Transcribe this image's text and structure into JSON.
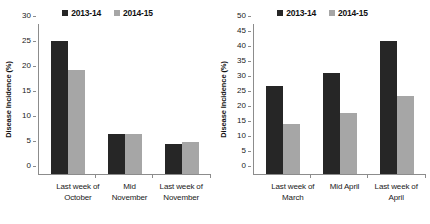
{
  "chart_data": [
    {
      "id": "autumn-chart",
      "type": "bar",
      "title": "",
      "xlabel": "",
      "ylabel": "Disease Incidence (%)",
      "ylim": [
        0,
        30
      ],
      "yticks": [
        0,
        5,
        10,
        15,
        20,
        25,
        30
      ],
      "ytick_labels": [
        "0",
        "5",
        "10",
        "15",
        "20",
        "25",
        "30"
      ],
      "grid": false,
      "legend_position": "top-center",
      "categories": [
        "Last week of October",
        "Mid November",
        "Last week of November"
      ],
      "category_lines": [
        [
          "Last week of",
          "October"
        ],
        [
          "Mid",
          "November"
        ],
        [
          "Last week of",
          "November"
        ]
      ],
      "series": [
        {
          "name": "2013-14",
          "color": "#262626",
          "values": [
            26.7,
            8.0,
            6.1
          ]
        },
        {
          "name": "2014-15",
          "color": "#a6a6a6",
          "values": [
            20.9,
            8.0,
            6.4
          ]
        }
      ]
    },
    {
      "id": "spring-chart",
      "type": "bar",
      "title": "",
      "xlabel": "",
      "ylabel": "Disease Incidence (%)",
      "ylim": [
        0,
        50
      ],
      "yticks": [
        0,
        5,
        10,
        15,
        20,
        25,
        30,
        35,
        40,
        45,
        50
      ],
      "ytick_labels": [
        "0",
        "5",
        "10",
        "15",
        "20",
        "25",
        "30",
        "35",
        "40",
        "45",
        "50"
      ],
      "grid": false,
      "legend_position": "top-center",
      "categories": [
        "Last week of March",
        "Mid April",
        "Last week of April"
      ],
      "category_lines": [
        [
          "Last week of",
          "March"
        ],
        [
          "Mid April",
          ""
        ],
        [
          "Last week of",
          "April"
        ]
      ],
      "series": [
        {
          "name": "2013-14",
          "color": "#262626",
          "values": [
            29.3,
            33.6,
            44.2
          ]
        },
        {
          "name": "2014-15",
          "color": "#a6a6a6",
          "values": [
            16.7,
            20.3,
            25.9
          ]
        }
      ]
    }
  ],
  "colors": {
    "series_2013_14": "#262626",
    "series_2014_15": "#a6a6a6",
    "axis": "#8c8c8c",
    "text": "#1a1a1a",
    "background": "#ffffff"
  }
}
